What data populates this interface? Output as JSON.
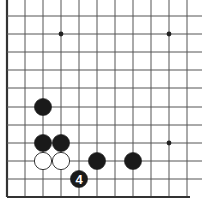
{
  "diagram": {
    "type": "go-board-fragment",
    "grid": {
      "columns_x": [
        7,
        25,
        43,
        61,
        79,
        97,
        115,
        133,
        151,
        169,
        187
      ],
      "rows_y": [
        16,
        34,
        52,
        70,
        88,
        107,
        125,
        143,
        161,
        179,
        197
      ],
      "left_edge_thick": true,
      "bottom_edge_thick": true,
      "line_color": "#555555",
      "edge_color": "#333333"
    },
    "star_points": [
      {
        "col": 3,
        "row": 1
      },
      {
        "col": 9,
        "row": 1
      },
      {
        "col": 9,
        "row": 7
      }
    ],
    "stones": [
      {
        "color": "black",
        "col": 2,
        "row": 5,
        "label": ""
      },
      {
        "color": "black",
        "col": 2,
        "row": 7,
        "label": ""
      },
      {
        "color": "black",
        "col": 3,
        "row": 7,
        "label": ""
      },
      {
        "color": "white",
        "col": 2,
        "row": 8,
        "label": ""
      },
      {
        "color": "white",
        "col": 3,
        "row": 8,
        "label": ""
      },
      {
        "color": "black",
        "col": 5,
        "row": 8,
        "label": ""
      },
      {
        "color": "black",
        "col": 7,
        "row": 8,
        "label": ""
      },
      {
        "color": "black",
        "col": 4,
        "row": 9,
        "label": "4"
      }
    ],
    "colors": {
      "black_stone": "#1a1a1a",
      "white_stone": "#ffffff",
      "stone_outline": "#222222",
      "label_on_black": "#ffffff"
    }
  }
}
